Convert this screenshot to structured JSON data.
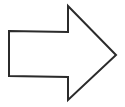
{
  "diagram": {
    "shape": "block-arrow",
    "direction": "right",
    "stroke_color": "#2b2b2b",
    "fill_color": "#ffffff",
    "background": "#ffffff",
    "stroke_width": 2,
    "points": "9,31 68,32 68,6 116,55 68,100 68,77 9,76"
  }
}
